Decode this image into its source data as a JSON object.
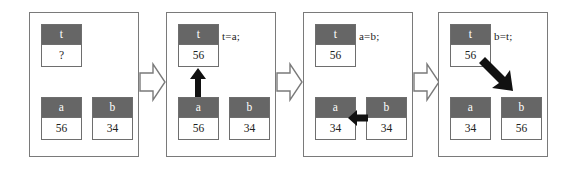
{
  "diagram": {
    "colors": {
      "box_header_fill": "#666666",
      "box_body_fill": "#ffffff",
      "box_border": "#6e6e6e",
      "panel_border": "#7a7a7a",
      "arrow_fill": "#111111",
      "connector_fill": "#ffffff",
      "connector_stroke": "#7a7a7a",
      "background": "#ffffff",
      "header_text": "#ffffff",
      "body_text": "#202020"
    },
    "panels": [
      {
        "id": "panel-1",
        "code": "",
        "variables": [
          {
            "name": "t",
            "value": "?"
          },
          {
            "name": "a",
            "value": "56"
          },
          {
            "name": "b",
            "value": "34"
          }
        ],
        "arrow": "none"
      },
      {
        "id": "panel-2",
        "code": "t=a;",
        "variables": [
          {
            "name": "t",
            "value": "56"
          },
          {
            "name": "a",
            "value": "56"
          },
          {
            "name": "b",
            "value": "34"
          }
        ],
        "arrow": "up-arrow-a-to-t"
      },
      {
        "id": "panel-3",
        "code": "a=b;",
        "variables": [
          {
            "name": "t",
            "value": "56"
          },
          {
            "name": "a",
            "value": "34"
          },
          {
            "name": "b",
            "value": "34"
          }
        ],
        "arrow": "left-arrow-b-to-a"
      },
      {
        "id": "panel-4",
        "code": "b=t;",
        "variables": [
          {
            "name": "t",
            "value": "56"
          },
          {
            "name": "a",
            "value": "34"
          },
          {
            "name": "b",
            "value": "56"
          }
        ],
        "arrow": "diagonal-arrow-t-to-b"
      }
    ],
    "connectors": [
      {
        "id": "connector-1",
        "direction": "right"
      },
      {
        "id": "connector-2",
        "direction": "right"
      },
      {
        "id": "connector-3",
        "direction": "right"
      }
    ]
  }
}
